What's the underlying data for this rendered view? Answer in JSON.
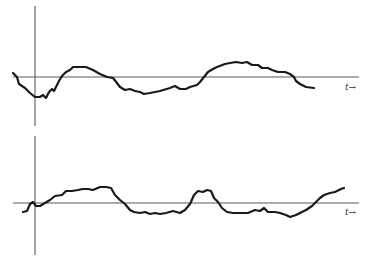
{
  "figure": {
    "line_color": "#1a1a1a",
    "axis_color": "#5a5a5a"
  },
  "plots": [
    {
      "name": "top-signal",
      "axis_label": "t→",
      "vertical_axis": {
        "x": 35,
        "y1": 6,
        "y2": 126
      },
      "time_axis": {
        "y": 77,
        "x1": 13,
        "x2": 359
      },
      "label_pos": {
        "x": 345,
        "y": 90
      },
      "points": "13,73 17,77 19,84 25,88 30,93 35,97 40,97 43,95 46,98 49,92 52,89 54,91 56,87 59,81 62,76 66,72 70,70 73,67 78,67 86,67 93,70 100,74 107,77 113,78 117,83 120,87 125,90 130,89 135,91 140,92 144,94 150,93 160,91 170,88 175,86 180,89 186,89 190,87 197,85 200,82 204,77 208,72 213,69 217,67 225,64 230,63 236,62 242,63 247,62 252,65 258,65 262,68 268,68 272,70 278,72 285,72 290,74 294,77 296,81 300,84 306,87 314,88"
    },
    {
      "name": "bottom-signal",
      "axis_label": "t→",
      "vertical_axis": {
        "x": 35,
        "y1": 136,
        "y2": 255
      },
      "time_axis": {
        "y": 203,
        "x1": 13,
        "x2": 359
      },
      "label_pos": {
        "x": 345,
        "y": 215
      },
      "points": "23,212 27,211 30,204 33,202 36,206 40,206 45,203 50,200 55,196 62,195 66,191 72,191 78,190 83,189 88,189 93,190 100,187 106,187 111,188 115,195 120,200 125,204 130,210 134,212 140,213 145,212 150,214 155,213 160,214 166,213 173,211 180,213 185,210 190,204 194,195 198,191 203,192 207,190 211,191 214,198 218,202 222,208 227,212 233,213 240,213 248,213 255,210 260,211 264,208 268,212 275,212 280,213 286,215 290,217 296,215 300,213 306,210 312,206 316,202 320,198 324,195 330,193 335,192 341,189 344,188"
    }
  ]
}
